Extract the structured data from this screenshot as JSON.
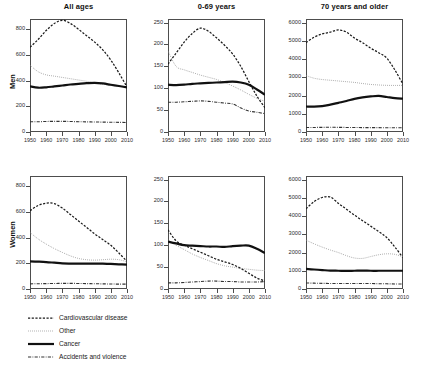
{
  "figure": {
    "row_labels": [
      "Men",
      "Women"
    ],
    "column_titles": [
      "All ages",
      "0-69 years",
      "70 years and older"
    ]
  },
  "legend": {
    "items": [
      {
        "label": "Cardiovascular disease",
        "style": "dashed",
        "color": "#1a1a1a"
      },
      {
        "label": "Other",
        "style": "dotted",
        "color": "#8c8c8c"
      },
      {
        "label": "Cancer",
        "style": "solid-thick",
        "color": "#111111"
      },
      {
        "label": "Accidents and violence",
        "style": "dash-dot",
        "color": "#333333"
      }
    ]
  },
  "chart_data": [
    {
      "type": "line",
      "title": "All ages",
      "panel": "Men / All ages",
      "row": "Men",
      "xlabel": "",
      "ylabel": "Men",
      "xlim": [
        1950,
        2010
      ],
      "ylim": [
        0,
        880
      ],
      "xticks": [
        1950,
        1960,
        1970,
        1980,
        1990,
        2000,
        2010
      ],
      "yticks": [
        0,
        200,
        400,
        600,
        800
      ],
      "grid": false,
      "legend_position": "below-figure",
      "x": [
        1950,
        1955,
        1960,
        1965,
        1970,
        1975,
        1980,
        1985,
        1990,
        1995,
        2000,
        2005,
        2010
      ],
      "series": [
        {
          "name": "Cardiovascular disease",
          "values": [
            660,
            720,
            790,
            845,
            870,
            845,
            800,
            750,
            700,
            640,
            560,
            460,
            350
          ]
        },
        {
          "name": "Other",
          "values": [
            520,
            470,
            445,
            435,
            425,
            415,
            405,
            395,
            382,
            372,
            365,
            358,
            350
          ]
        },
        {
          "name": "Cancer",
          "values": [
            355,
            345,
            348,
            355,
            362,
            370,
            375,
            380,
            383,
            378,
            368,
            358,
            348
          ]
        },
        {
          "name": "Accidents and violence",
          "values": [
            80,
            80,
            82,
            83,
            83,
            82,
            80,
            79,
            78,
            77,
            76,
            75,
            74
          ]
        }
      ]
    },
    {
      "type": "line",
      "title": "0-69 years",
      "panel": "Men / 0-69 years",
      "row": "Men",
      "xlabel": "",
      "ylabel": "Men",
      "xlim": [
        1950,
        2010
      ],
      "ylim": [
        0,
        258
      ],
      "xticks": [
        1950,
        1960,
        1970,
        1980,
        1990,
        2000,
        2010
      ],
      "yticks": [
        0,
        50,
        100,
        150,
        200,
        250
      ],
      "grid": false,
      "legend_position": "below-figure",
      "x": [
        1950,
        1955,
        1960,
        1965,
        1970,
        1975,
        1980,
        1985,
        1990,
        1995,
        2000,
        2005,
        2010
      ],
      "series": [
        {
          "name": "Cardiovascular disease",
          "values": [
            155,
            180,
            205,
            225,
            237,
            230,
            215,
            198,
            178,
            150,
            115,
            82,
            55
          ]
        },
        {
          "name": "Other",
          "values": [
            185,
            150,
            142,
            136,
            130,
            125,
            120,
            113,
            105,
            96,
            86,
            77,
            70
          ]
        },
        {
          "name": "Cancer",
          "values": [
            108,
            107,
            108,
            110,
            111,
            112,
            113,
            114,
            115,
            113,
            108,
            97,
            85
          ]
        },
        {
          "name": "Accidents and violence",
          "values": [
            68,
            68,
            69,
            70,
            71,
            70,
            68,
            66,
            64,
            55,
            48,
            45,
            42
          ]
        }
      ]
    },
    {
      "type": "line",
      "title": "70 years and older",
      "panel": "Men / 70 years and older",
      "row": "Men",
      "xlabel": "",
      "ylabel": "Men",
      "xlim": [
        1950,
        2010
      ],
      "ylim": [
        0,
        6200
      ],
      "xticks": [
        1950,
        1960,
        1970,
        1980,
        1990,
        2000,
        2010
      ],
      "yticks": [
        0,
        1000,
        2000,
        3000,
        4000,
        5000,
        6000
      ],
      "grid": false,
      "legend_position": "below-figure",
      "x": [
        1950,
        1955,
        1960,
        1965,
        1970,
        1975,
        1980,
        1985,
        1990,
        1995,
        2000,
        2005,
        2010
      ],
      "series": [
        {
          "name": "Cardiovascular disease",
          "values": [
            4900,
            5200,
            5380,
            5480,
            5600,
            5480,
            5150,
            4900,
            4600,
            4350,
            4050,
            3400,
            2620
          ]
        },
        {
          "name": "Other",
          "values": [
            3100,
            2950,
            2880,
            2840,
            2800,
            2760,
            2720,
            2660,
            2610,
            2580,
            2560,
            2555,
            2560
          ]
        },
        {
          "name": "Cancer",
          "values": [
            1400,
            1390,
            1420,
            1500,
            1600,
            1700,
            1820,
            1900,
            1950,
            1980,
            1920,
            1860,
            1830
          ]
        },
        {
          "name": "Accidents and violence",
          "values": [
            250,
            250,
            255,
            258,
            255,
            250,
            245,
            242,
            240,
            238,
            235,
            232,
            230
          ]
        }
      ]
    },
    {
      "type": "line",
      "title": "All ages",
      "panel": "Women / All ages",
      "row": "Women",
      "xlabel": "",
      "ylabel": "Women",
      "xlim": [
        1950,
        2010
      ],
      "ylim": [
        0,
        880
      ],
      "xticks": [
        1950,
        1960,
        1970,
        1980,
        1990,
        2000,
        2010
      ],
      "yticks": [
        0,
        200,
        400,
        600,
        800
      ],
      "grid": false,
      "legend_position": "below-figure",
      "x": [
        1950,
        1955,
        1960,
        1965,
        1970,
        1975,
        1980,
        1985,
        1990,
        1995,
        2000,
        2005,
        2010
      ],
      "series": [
        {
          "name": "Cardiovascular disease",
          "values": [
            610,
            650,
            668,
            665,
            630,
            580,
            530,
            480,
            430,
            385,
            340,
            280,
            215
          ]
        },
        {
          "name": "Other",
          "values": [
            440,
            390,
            350,
            315,
            285,
            258,
            238,
            228,
            225,
            228,
            232,
            228,
            212
          ]
        },
        {
          "name": "Cancer",
          "values": [
            215,
            213,
            210,
            205,
            200,
            198,
            197,
            197,
            198,
            197,
            195,
            192,
            190
          ]
        },
        {
          "name": "Accidents and violence",
          "values": [
            40,
            41,
            42,
            43,
            44,
            44,
            43,
            42,
            41,
            40,
            39,
            38,
            38
          ]
        }
      ]
    },
    {
      "type": "line",
      "title": "0-69 years",
      "panel": "Women / 0-69 years",
      "row": "Women",
      "xlabel": "",
      "ylabel": "Women",
      "xlim": [
        1950,
        2010
      ],
      "ylim": [
        0,
        258
      ],
      "xticks": [
        1950,
        1960,
        1970,
        1980,
        1990,
        2000,
        2010
      ],
      "yticks": [
        0,
        50,
        100,
        150,
        200,
        250
      ],
      "grid": false,
      "legend_position": "below-figure",
      "x": [
        1950,
        1955,
        1960,
        1965,
        1970,
        1975,
        1980,
        1985,
        1990,
        1995,
        2000,
        2005,
        2010
      ],
      "series": [
        {
          "name": "Cardiovascular disease",
          "values": [
            135,
            110,
            100,
            92,
            84,
            76,
            68,
            62,
            56,
            47,
            36,
            25,
            18
          ]
        },
        {
          "name": "Other",
          "values": [
            112,
            100,
            90,
            80,
            72,
            65,
            58,
            53,
            50,
            47,
            45,
            43,
            42
          ]
        },
        {
          "name": "Cancer",
          "values": [
            108,
            104,
            100,
            99,
            98,
            97,
            97,
            96,
            98,
            99,
            99,
            92,
            82
          ]
        },
        {
          "name": "Accidents and violence",
          "values": [
            14,
            14,
            15,
            16,
            17,
            18,
            18,
            17,
            17,
            16,
            16,
            16,
            17
          ]
        }
      ]
    },
    {
      "type": "line",
      "title": "70 years and older",
      "panel": "Women / 70 years and older",
      "row": "Women",
      "xlabel": "",
      "ylabel": "Women",
      "xlim": [
        1950,
        2010
      ],
      "ylim": [
        0,
        6200
      ],
      "xticks": [
        1950,
        1960,
        1970,
        1980,
        1990,
        2000,
        2010
      ],
      "yticks": [
        0,
        1000,
        2000,
        3000,
        4000,
        5000,
        6000
      ],
      "grid": false,
      "legend_position": "below-figure",
      "x": [
        1950,
        1955,
        1960,
        1965,
        1970,
        1975,
        1980,
        1985,
        1990,
        1995,
        2000,
        2005,
        2010
      ],
      "series": [
        {
          "name": "Cardiovascular disease",
          "values": [
            4400,
            4800,
            5020,
            5050,
            4700,
            4380,
            4050,
            3750,
            3450,
            3150,
            2820,
            2300,
            1720
          ]
        },
        {
          "name": "Other",
          "values": [
            2680,
            2480,
            2300,
            2140,
            2000,
            1830,
            1700,
            1680,
            1780,
            1880,
            1930,
            1900,
            1760
          ]
        },
        {
          "name": "Cancer",
          "values": [
            1100,
            1070,
            1040,
            1010,
            1000,
            990,
            1000,
            1010,
            1000,
            1000,
            1000,
            1000,
            1000
          ]
        },
        {
          "name": "Accidents and violence",
          "values": [
            330,
            320,
            310,
            305,
            300,
            300,
            300,
            300,
            300,
            290,
            285,
            275,
            270
          ]
        }
      ]
    }
  ]
}
